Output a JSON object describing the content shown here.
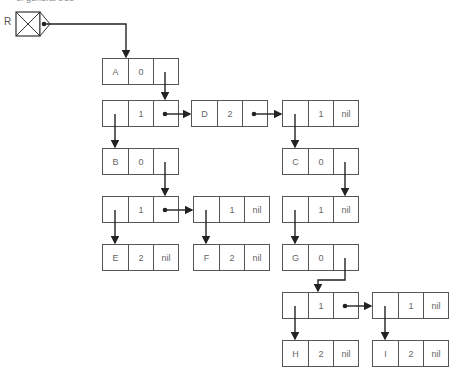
{
  "caption": "of general tree",
  "root_label": "R",
  "nodes": [
    {
      "id": "A",
      "cells": [
        "A",
        "0",
        ""
      ],
      "x": 102,
      "y": 58
    },
    {
      "id": "L1",
      "cells": [
        "",
        "1",
        ""
      ],
      "x": 102,
      "y": 100
    },
    {
      "id": "D",
      "cells": [
        "D",
        "2",
        ""
      ],
      "x": 191,
      "y": 100
    },
    {
      "id": "L2",
      "cells": [
        "",
        "1",
        "nil"
      ],
      "x": 282,
      "y": 100
    },
    {
      "id": "B",
      "cells": [
        "B",
        "0",
        ""
      ],
      "x": 102,
      "y": 148
    },
    {
      "id": "C",
      "cells": [
        "C",
        "0",
        ""
      ],
      "x": 282,
      "y": 148
    },
    {
      "id": "L3",
      "cells": [
        "",
        "1",
        ""
      ],
      "x": 102,
      "y": 196
    },
    {
      "id": "L4",
      "cells": [
        "",
        "1",
        "nil"
      ],
      "x": 193,
      "y": 196
    },
    {
      "id": "L5",
      "cells": [
        "",
        "1",
        "nil"
      ],
      "x": 282,
      "y": 196
    },
    {
      "id": "E",
      "cells": [
        "E",
        "2",
        "nil"
      ],
      "x": 102,
      "y": 244
    },
    {
      "id": "F",
      "cells": [
        "F",
        "2",
        "nil"
      ],
      "x": 193,
      "y": 244
    },
    {
      "id": "G",
      "cells": [
        "G",
        "0",
        ""
      ],
      "x": 282,
      "y": 244
    },
    {
      "id": "L6",
      "cells": [
        "",
        "1",
        ""
      ],
      "x": 282,
      "y": 292
    },
    {
      "id": "L7",
      "cells": [
        "",
        "1",
        "nil"
      ],
      "x": 372,
      "y": 292
    },
    {
      "id": "H",
      "cells": [
        "H",
        "2",
        "nil"
      ],
      "x": 282,
      "y": 340
    },
    {
      "id": "I",
      "cells": [
        "I",
        "2",
        "nil"
      ],
      "x": 372,
      "y": 340
    }
  ]
}
